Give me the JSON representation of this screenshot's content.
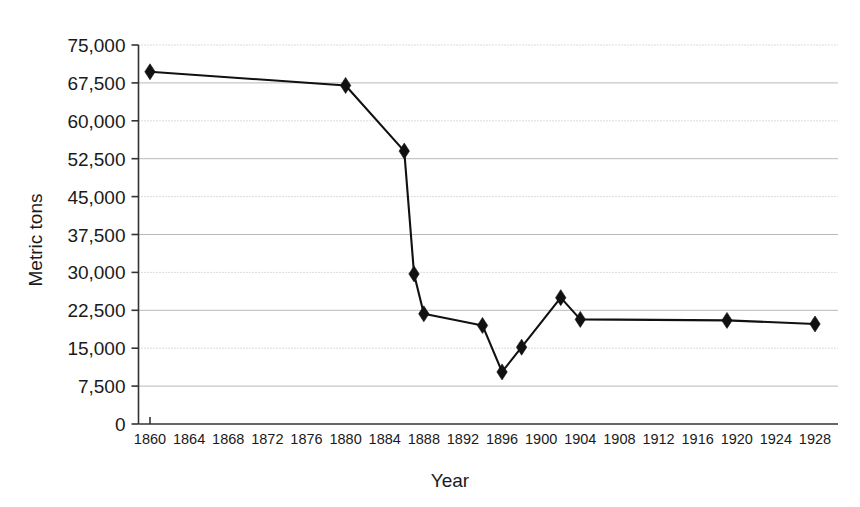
{
  "chart_data": {
    "type": "line",
    "title": "",
    "subtitle": "",
    "xlabel": "Year",
    "ylabel": "Metric tons",
    "xlim": [
      1860,
      1930
    ],
    "ylim": [
      0,
      75000
    ],
    "grid": true,
    "legend_position": "none",
    "xticks": [
      1860,
      1864,
      1868,
      1872,
      1876,
      1880,
      1884,
      1888,
      1892,
      1896,
      1900,
      1904,
      1908,
      1912,
      1916,
      1920,
      1924,
      1928
    ],
    "xtick_labels": [
      "1860",
      "1864",
      "1868",
      "1872",
      "1876",
      "1880",
      "1884",
      "1888",
      "1892",
      "1896",
      "1900",
      "1904",
      "1908",
      "1912",
      "1916",
      "1920",
      "1924",
      "1928"
    ],
    "yticks": [
      0,
      7500,
      15000,
      22500,
      30000,
      37500,
      45000,
      52500,
      60000,
      67500,
      75000
    ],
    "ytick_labels": [
      "0",
      "7,500",
      "15,000",
      "22,500",
      "30,000",
      "37,500",
      "45,000",
      "52,500",
      "60,000",
      "67,500",
      "75,000"
    ],
    "marker": "diamond",
    "line_color": "#111111",
    "marker_color": "#111111",
    "x": [
      1860,
      1880,
      1886,
      1887,
      1888,
      1894,
      1896,
      1898,
      1902,
      1904,
      1919,
      1928
    ],
    "values": [
      69700,
      67000,
      54000,
      29700,
      21800,
      19500,
      10300,
      15200,
      25000,
      20700,
      20500,
      19800
    ],
    "series": [
      {
        "name": "Metric tons",
        "x": [
          1860,
          1880,
          1886,
          1887,
          1888,
          1894,
          1896,
          1898,
          1902,
          1904,
          1919,
          1928
        ],
        "values": [
          69700,
          67000,
          54000,
          29700,
          21800,
          19500,
          10300,
          15200,
          25000,
          20700,
          20500,
          19800
        ]
      }
    ]
  },
  "axes": {
    "y_title": "Metric tons",
    "x_title": "Year"
  }
}
